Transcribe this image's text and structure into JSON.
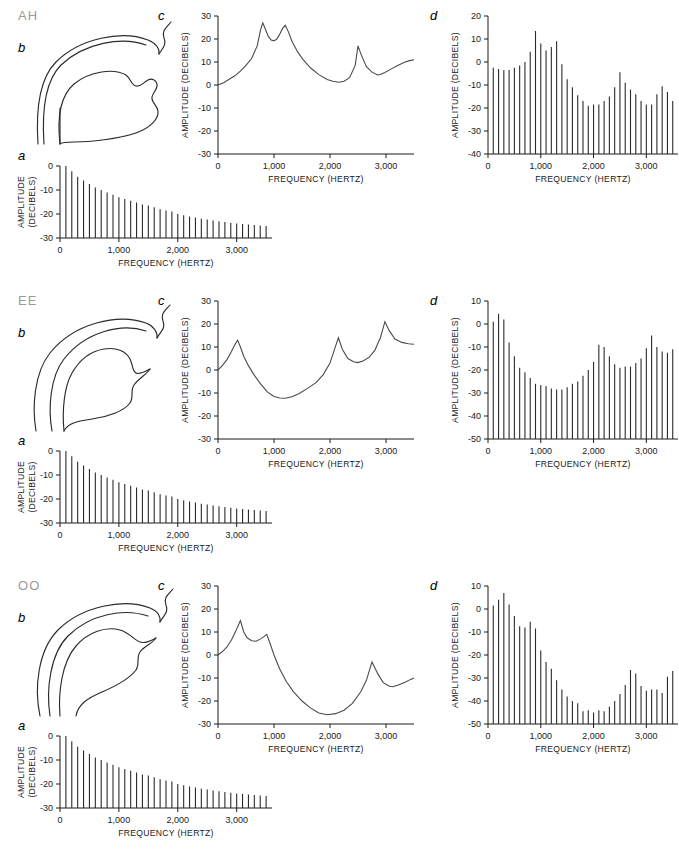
{
  "figure": {
    "panel_letters": {
      "a": "a",
      "b": "b",
      "c": "c",
      "d": "d"
    },
    "axis_titles": {
      "x": "FREQUENCY (HERTZ)",
      "y_single": "AMPLITUDE (DECIBELS)",
      "y_line1": "AMPLITUDE",
      "y_line2": "(DECIBELS)"
    },
    "colors": {
      "vowel_label": "#9a9a9a",
      "ink": "#1a1a1a",
      "curve": "#4a4a4a",
      "bar": "#2b2b2b",
      "background": "#ffffff"
    }
  },
  "chart_data": [
    {
      "id": "ah-source",
      "type": "bar",
      "vowel": "AH",
      "panel": "a",
      "title": "",
      "xlabel": "FREQUENCY (HERTZ)",
      "ylabel": "AMPLITUDE (DECIBELS)",
      "xlim": [
        0,
        3600
      ],
      "ylim": [
        -30,
        0
      ],
      "xticks": [
        0,
        1000,
        2000,
        3000
      ],
      "xticklabels": [
        "0",
        "1,000",
        "2,000",
        "3,000"
      ],
      "yticks": [
        0,
        -10,
        -20,
        -30
      ],
      "yticklabels": [
        "0",
        "-10",
        "-20",
        "-30"
      ],
      "x": [
        100,
        200,
        300,
        400,
        500,
        600,
        700,
        800,
        900,
        1000,
        1100,
        1200,
        1300,
        1400,
        1500,
        1600,
        1700,
        1800,
        1900,
        2000,
        2100,
        2200,
        2300,
        2400,
        2500,
        2600,
        2700,
        2800,
        2900,
        3000,
        3100,
        3200,
        3300,
        3400,
        3500
      ],
      "values": [
        0,
        -2.2,
        -4.5,
        -6,
        -7.5,
        -9,
        -10,
        -11,
        -12,
        -13,
        -13.8,
        -14.5,
        -15.2,
        -16,
        -16.5,
        -17.2,
        -18,
        -18.5,
        -19,
        -20,
        -20.5,
        -21,
        -21.5,
        -22,
        -22.3,
        -22.7,
        -23,
        -23.3,
        -23.6,
        -24,
        -24.2,
        -24.4,
        -24.6,
        -24.8,
        -25
      ]
    },
    {
      "id": "ah-transfer",
      "type": "line",
      "vowel": "AH",
      "panel": "c",
      "xlabel": "FREQUENCY (HERTZ)",
      "ylabel": "AMPLITUDE (DECIBELS)",
      "xlim": [
        0,
        3500
      ],
      "ylim": [
        -30,
        30
      ],
      "xticks": [
        0,
        1000,
        2000,
        3000
      ],
      "xticklabels": [
        "0",
        "1,000",
        "2,000",
        "3,000"
      ],
      "yticks": [
        30,
        20,
        10,
        0,
        -10,
        -20,
        -30
      ],
      "yticklabels": [
        "30",
        "20",
        "10",
        "0",
        "-10",
        "-20",
        "-30"
      ],
      "formants": [
        800,
        1200,
        2500,
        3500
      ],
      "peak_values": [
        27,
        26,
        17,
        11
      ],
      "x": [
        0,
        100,
        200,
        300,
        400,
        500,
        600,
        700,
        760,
        800,
        850,
        900,
        950,
        1000,
        1050,
        1100,
        1150,
        1200,
        1260,
        1320,
        1420,
        1520,
        1650,
        1800,
        1950,
        2050,
        2150,
        2250,
        2350,
        2450,
        2500,
        2560,
        2650,
        2750,
        2850,
        2900,
        2980,
        3080,
        3200,
        3320,
        3420,
        3500
      ],
      "values": [
        0,
        1,
        2.5,
        4,
        6,
        8.5,
        11.5,
        17,
        24,
        27,
        24,
        21,
        19.6,
        19.2,
        20,
        22,
        24.5,
        26,
        23,
        19,
        14.5,
        11,
        7.5,
        4.5,
        2.4,
        1.6,
        1.2,
        1.6,
        3.2,
        8.5,
        17,
        13,
        8,
        5.6,
        4.4,
        4.6,
        5.4,
        6.8,
        8.4,
        9.8,
        10.6,
        11
      ]
    },
    {
      "id": "ah-output",
      "type": "bar",
      "vowel": "AH",
      "panel": "d",
      "xlabel": "FREQUENCY (HERTZ)",
      "ylabel": "AMPLITUDE (DECIBELS)",
      "xlim": [
        0,
        3600
      ],
      "ylim": [
        -40,
        20
      ],
      "xticks": [
        0,
        1000,
        2000,
        3000
      ],
      "xticklabels": [
        "0",
        "1,000",
        "2,000",
        "3,000"
      ],
      "yticks": [
        20,
        10,
        0,
        -10,
        -20,
        -30,
        -40
      ],
      "yticklabels": [
        "20",
        "10",
        "0",
        "-10",
        "-20",
        "-30",
        "-40"
      ],
      "x": [
        100,
        200,
        300,
        400,
        500,
        600,
        700,
        800,
        900,
        1000,
        1100,
        1200,
        1300,
        1400,
        1500,
        1600,
        1700,
        1800,
        1900,
        2000,
        2100,
        2200,
        2300,
        2400,
        2500,
        2600,
        2700,
        2800,
        2900,
        3000,
        3100,
        3200,
        3300,
        3400,
        3500
      ],
      "values": [
        -2.5,
        -3,
        -3.5,
        -3.5,
        -2.5,
        -1.5,
        0,
        4.5,
        13.5,
        8,
        5,
        6.5,
        9,
        -1,
        -7.5,
        -11,
        -14.5,
        -17,
        -19,
        -18.5,
        -18.5,
        -17,
        -15,
        -11,
        -4.5,
        -9,
        -12,
        -14,
        -17,
        -18.5,
        -18.5,
        -14,
        -10.5,
        -13,
        -17
      ]
    },
    {
      "id": "ee-source",
      "type": "bar",
      "vowel": "EE",
      "panel": "a",
      "xlabel": "FREQUENCY (HERTZ)",
      "ylabel": "AMPLITUDE (DECIBELS)",
      "xlim": [
        0,
        3600
      ],
      "ylim": [
        -30,
        0
      ],
      "xticks": [
        0,
        1000,
        2000,
        3000
      ],
      "xticklabels": [
        "0",
        "1,000",
        "2,000",
        "3,000"
      ],
      "yticks": [
        0,
        -10,
        -20,
        -30
      ],
      "yticklabels": [
        "0",
        "-10",
        "-20",
        "-30"
      ],
      "x": [
        100,
        200,
        300,
        400,
        500,
        600,
        700,
        800,
        900,
        1000,
        1100,
        1200,
        1300,
        1400,
        1500,
        1600,
        1700,
        1800,
        1900,
        2000,
        2100,
        2200,
        2300,
        2400,
        2500,
        2600,
        2700,
        2800,
        2900,
        3000,
        3100,
        3200,
        3300,
        3400,
        3500
      ],
      "values": [
        0,
        -2.2,
        -4.5,
        -6,
        -7.5,
        -9,
        -10,
        -11,
        -12,
        -13,
        -13.8,
        -14.5,
        -15.2,
        -16,
        -16.5,
        -17.2,
        -18,
        -18.5,
        -19,
        -20,
        -20.5,
        -21,
        -21.5,
        -22,
        -22.3,
        -22.7,
        -23,
        -23.3,
        -23.6,
        -24,
        -24.2,
        -24.4,
        -24.6,
        -24.8,
        -25
      ]
    },
    {
      "id": "ee-transfer",
      "type": "line",
      "vowel": "EE",
      "panel": "c",
      "xlabel": "FREQUENCY (HERTZ)",
      "ylabel": "AMPLITUDE (DECIBELS)",
      "xlim": [
        0,
        3500
      ],
      "ylim": [
        -30,
        30
      ],
      "xticks": [
        0,
        1000,
        2000,
        3000
      ],
      "xticklabels": [
        "0",
        "1,000",
        "2,000",
        "3,000"
      ],
      "yticks": [
        30,
        20,
        10,
        0,
        -10,
        -20,
        -30
      ],
      "yticklabels": [
        "30",
        "20",
        "10",
        "0",
        "-10",
        "-20",
        "-30"
      ],
      "formants": [
        350,
        2150,
        3000
      ],
      "peak_values": [
        13,
        14,
        21
      ],
      "x": [
        0,
        80,
        160,
        240,
        300,
        350,
        400,
        460,
        540,
        640,
        760,
        880,
        1000,
        1100,
        1200,
        1320,
        1450,
        1600,
        1750,
        1880,
        2000,
        2080,
        2150,
        2220,
        2320,
        2420,
        2500,
        2600,
        2700,
        2800,
        2900,
        2980,
        3060,
        3160,
        3280,
        3400,
        3500
      ],
      "values": [
        0,
        2,
        4.5,
        8,
        11,
        13,
        10,
        6,
        2,
        -2,
        -6,
        -9.5,
        -11.5,
        -12.2,
        -12.3,
        -11.6,
        -10.2,
        -8,
        -5.5,
        -2,
        3,
        9,
        14,
        9,
        5,
        3.6,
        3.2,
        4,
        5.6,
        8.5,
        14,
        21,
        17,
        13.5,
        12,
        11.4,
        11.2
      ]
    },
    {
      "id": "ee-output",
      "type": "bar",
      "vowel": "EE",
      "panel": "d",
      "xlabel": "FREQUENCY (HERTZ)",
      "ylabel": "AMPLITUDE (DECIBELS)",
      "xlim": [
        0,
        3600
      ],
      "ylim": [
        -50,
        10
      ],
      "xticks": [
        0,
        1000,
        2000,
        3000
      ],
      "xticklabels": [
        "0",
        "1,000",
        "2,000",
        "3,000"
      ],
      "yticks": [
        10,
        0,
        -10,
        -20,
        -30,
        -40,
        -50
      ],
      "yticklabels": [
        "10",
        "0",
        "-10",
        "-20",
        "-30",
        "-40",
        "-50"
      ],
      "x": [
        100,
        200,
        300,
        400,
        500,
        600,
        700,
        800,
        900,
        1000,
        1100,
        1200,
        1300,
        1400,
        1500,
        1600,
        1700,
        1800,
        1900,
        2000,
        2100,
        2200,
        2300,
        2400,
        2500,
        2600,
        2700,
        2800,
        2900,
        3000,
        3100,
        3200,
        3300,
        3400,
        3500
      ],
      "values": [
        1,
        4.5,
        2,
        -8,
        -14,
        -19,
        -21,
        -23.5,
        -26,
        -26.5,
        -27,
        -28,
        -28.5,
        -28.5,
        -27.5,
        -26,
        -25,
        -22.5,
        -20,
        -16.5,
        -9,
        -10,
        -14,
        -17.5,
        -19,
        -18.5,
        -18.5,
        -17,
        -15,
        -10.5,
        -5,
        -10,
        -12,
        -12.5,
        -11
      ]
    },
    {
      "id": "oo-source",
      "type": "bar",
      "vowel": "OO",
      "panel": "a",
      "xlabel": "FREQUENCY (HERTZ)",
      "ylabel": "AMPLITUDE (DECIBELS)",
      "xlim": [
        0,
        3600
      ],
      "ylim": [
        -30,
        0
      ],
      "xticks": [
        0,
        1000,
        2000,
        3000
      ],
      "xticklabels": [
        "0",
        "1,000",
        "2,000",
        "3,000"
      ],
      "yticks": [
        0,
        -10,
        -20,
        -30
      ],
      "yticklabels": [
        "0",
        "-10",
        "-20",
        "-30"
      ],
      "x": [
        100,
        200,
        300,
        400,
        500,
        600,
        700,
        800,
        900,
        1000,
        1100,
        1200,
        1300,
        1400,
        1500,
        1600,
        1700,
        1800,
        1900,
        2000,
        2100,
        2200,
        2300,
        2400,
        2500,
        2600,
        2700,
        2800,
        2900,
        3000,
        3100,
        3200,
        3300,
        3400,
        3500
      ],
      "values": [
        0,
        -2.2,
        -4.5,
        -6,
        -7.5,
        -9,
        -10,
        -11,
        -12,
        -13,
        -13.8,
        -14.5,
        -15.2,
        -16,
        -16.5,
        -17.2,
        -18,
        -18.5,
        -19,
        -20,
        -20.5,
        -21,
        -21.5,
        -22,
        -22.3,
        -22.7,
        -23,
        -23.3,
        -23.6,
        -24,
        -24.2,
        -24.4,
        -24.6,
        -24.8,
        -25
      ]
    },
    {
      "id": "oo-transfer",
      "type": "line",
      "vowel": "OO",
      "panel": "c",
      "xlabel": "FREQUENCY (HERTZ)",
      "ylabel": "AMPLITUDE (DECIBELS)",
      "xlim": [
        0,
        3500
      ],
      "ylim": [
        -30,
        30
      ],
      "xticks": [
        0,
        1000,
        2000,
        3000
      ],
      "xticklabels": [
        "0",
        "1,000",
        "2,000",
        "3,000"
      ],
      "yticks": [
        30,
        20,
        10,
        0,
        -10,
        -20,
        -30
      ],
      "yticklabels": [
        "30",
        "20",
        "10",
        "0",
        "-10",
        "-20",
        "-30"
      ],
      "formants": [
        400,
        870,
        2750
      ],
      "peak_values": [
        15,
        9,
        -3
      ],
      "x": [
        0,
        80,
        160,
        240,
        320,
        400,
        460,
        520,
        600,
        680,
        760,
        820,
        870,
        930,
        1000,
        1100,
        1220,
        1350,
        1500,
        1650,
        1800,
        1950,
        2100,
        2250,
        2400,
        2550,
        2650,
        2750,
        2850,
        2950,
        3050,
        3120,
        3220,
        3340,
        3440,
        3500
      ],
      "values": [
        0,
        1.5,
        3.5,
        6.5,
        10.5,
        15,
        10,
        7.5,
        6.2,
        6,
        7,
        8,
        9,
        5,
        0,
        -6,
        -11.5,
        -16,
        -20,
        -23,
        -25.2,
        -26,
        -25.5,
        -24,
        -21,
        -16,
        -11,
        -3,
        -8,
        -12,
        -13.5,
        -13.8,
        -13,
        -11.8,
        -10.6,
        -10
      ]
    },
    {
      "id": "oo-output",
      "type": "bar",
      "vowel": "OO",
      "panel": "d",
      "xlabel": "FREQUENCY (HERTZ)",
      "ylabel": "AMPLITUDE (DECIBELS)",
      "xlim": [
        0,
        3600
      ],
      "ylim": [
        -50,
        10
      ],
      "xticks": [
        0,
        1000,
        2000,
        3000
      ],
      "xticklabels": [
        "0",
        "1,000",
        "2,000",
        "3,000"
      ],
      "yticks": [
        10,
        0,
        -10,
        -20,
        -30,
        -40,
        -50
      ],
      "yticklabels": [
        "10",
        "0",
        "-10",
        "-20",
        "-30",
        "-40",
        "-50"
      ],
      "x": [
        100,
        200,
        300,
        400,
        500,
        600,
        700,
        800,
        900,
        1000,
        1100,
        1200,
        1300,
        1400,
        1500,
        1600,
        1700,
        1800,
        1900,
        2000,
        2100,
        2200,
        2300,
        2400,
        2500,
        2600,
        2700,
        2800,
        2900,
        3000,
        3100,
        3200,
        3300,
        3400,
        3500
      ],
      "values": [
        1.5,
        4,
        7,
        2,
        -3,
        -7.5,
        -8,
        -5.5,
        -8.5,
        -18,
        -23,
        -26,
        -31,
        -35,
        -38,
        -40,
        -41,
        -44.5,
        -44,
        -45,
        -44,
        -44.5,
        -42.5,
        -40,
        -37,
        -33,
        -26.5,
        -28,
        -33.5,
        -35.5,
        -35,
        -35,
        -36.5,
        -29.5,
        -27
      ]
    }
  ],
  "rows": [
    {
      "vowel": "AH",
      "profile": "vocal-tract-ah"
    },
    {
      "vowel": "EE",
      "profile": "vocal-tract-ee"
    },
    {
      "vowel": "OO",
      "profile": "vocal-tract-oo"
    }
  ]
}
